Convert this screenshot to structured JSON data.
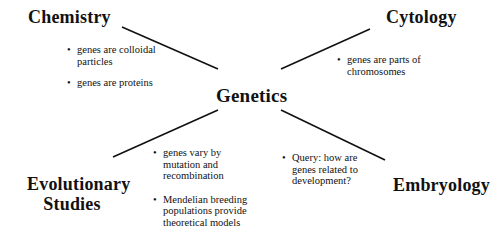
{
  "diagram": {
    "center": "Genetics",
    "branches": {
      "chemistry": {
        "title": "Chemistry",
        "bullets": [
          "genes are colloidal particles",
          "genes are proteins"
        ]
      },
      "cytology": {
        "title": "Cytology",
        "bullets": [
          "genes are parts of chromosomes"
        ]
      },
      "evolutionary": {
        "title_line1": "Evolutionary",
        "title_line2": "Studies",
        "bullets": [
          "genes vary by mutation and recombination",
          "Mendelian breeding populations provide theoretical models"
        ]
      },
      "embryology": {
        "title": "Embryology",
        "bullets": [
          "Query:  how are genes related to development?"
        ]
      }
    },
    "bullet_glyph": "•",
    "line_color": "#111111"
  }
}
